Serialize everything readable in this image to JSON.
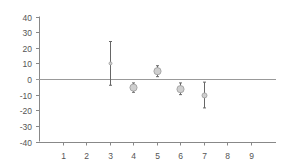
{
  "chart_data": {
    "type": "scatter",
    "title": "",
    "xlabel": "",
    "ylabel": "",
    "xlim": [
      0,
      10
    ],
    "ylim": [
      -40,
      40
    ],
    "x_ticks": [
      1,
      2,
      3,
      4,
      5,
      6,
      7,
      8,
      9
    ],
    "y_ticks": [
      40,
      30,
      20,
      10,
      0,
      -10,
      -20,
      -30,
      -40
    ],
    "grid": false,
    "legend": null,
    "series": [
      {
        "name": "values",
        "points": [
          {
            "x": 3,
            "y": 10,
            "err_low": -4,
            "err_high": 24,
            "marker_size": "small"
          },
          {
            "x": 4,
            "y": -5.5,
            "err_low": -8.5,
            "err_high": -2.5,
            "marker_size": "large"
          },
          {
            "x": 5,
            "y": 5,
            "err_low": 1.5,
            "err_high": 8.5,
            "marker_size": "large"
          },
          {
            "x": 6,
            "y": -6.5,
            "err_low": -10,
            "err_high": -2.5,
            "marker_size": "large"
          },
          {
            "x": 7,
            "y": -10.5,
            "err_low": -18.5,
            "err_high": -2,
            "marker_size": "medium"
          }
        ]
      }
    ],
    "colors": {
      "axis": "#888888",
      "zero_line": "#999999",
      "marker_fill": "#cfcfcf",
      "marker_stroke": "#9a9a9a",
      "error_bar": "#666666",
      "tick_label": "#555555"
    }
  }
}
